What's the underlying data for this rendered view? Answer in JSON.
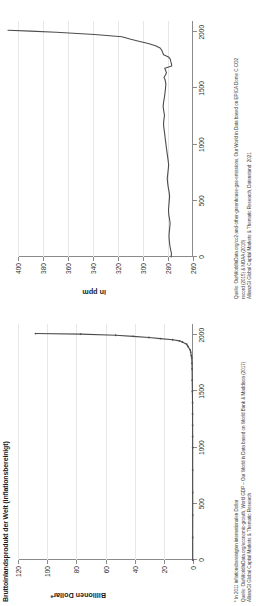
{
  "figure": {
    "background": "#ffffff",
    "line_color": "#4d4d4d",
    "grid_color": "#e8e8e8",
    "axis_color": "#8a8a8a"
  },
  "panels": [
    {
      "id": "gdp",
      "title": "Bruttoinlandsprodukt der Welt (inflationsbereinigt)",
      "ylabel": "Billionen Dollar*",
      "footnotes": [
        "* In 2011 inflationsbereinigten internationalen Dollar",
        "Quelle: OurWorldInData.org/economic-growth, World GDP – Our World in Data based on World Bank & Maddison (2017)",
        "AllianzGI Global Capital Markets & Thematic Research"
      ]
    },
    {
      "id": "co2",
      "title": "",
      "ylabel": "in ppm",
      "footnotes": [
        "Quelle: OurWorldInData.org/co2-and-other-greenhouse-gas-emissions, Our World in Data based on EPICA Dome C CO2",
        "record (2015) & NOAA (2018)",
        "AllianzGI Global Capital Markets & Thematic Research, Datenstand: 2021"
      ]
    }
  ],
  "chart_data": [
    {
      "type": "line",
      "title": "Bruttoinlandsprodukt der Welt (inflationsbereinigt)",
      "xlabel": "",
      "ylabel": "Billionen Dollar*",
      "xlim": [
        0,
        2100
      ],
      "ylim": [
        0,
        120
      ],
      "xticks": [
        0,
        500,
        1000,
        1500,
        2000
      ],
      "yticks": [
        0,
        20,
        40,
        60,
        80,
        100,
        120
      ],
      "grid": true,
      "legend": "none",
      "x": [
        1,
        200,
        400,
        600,
        800,
        1000,
        1100,
        1200,
        1300,
        1400,
        1500,
        1600,
        1700,
        1750,
        1800,
        1820,
        1850,
        1870,
        1900,
        1920,
        1940,
        1950,
        1960,
        1970,
        1980,
        1990,
        2000,
        2010,
        2015
      ],
      "values": [
        0.18,
        0.19,
        0.18,
        0.19,
        0.21,
        0.21,
        0.23,
        0.26,
        0.29,
        0.3,
        0.43,
        0.55,
        0.64,
        0.73,
        0.89,
        1.2,
        1.55,
        1.98,
        3.42,
        4.36,
        7.31,
        9.25,
        13.9,
        22.3,
        30.2,
        41.0,
        53.0,
        77.0,
        108.0
      ]
    },
    {
      "type": "line",
      "title": "",
      "xlabel": "",
      "ylabel": "in ppm",
      "xlim": [
        0,
        2100
      ],
      "ylim": [
        260,
        400
      ],
      "xticks": [
        0,
        500,
        1000,
        1500,
        2000
      ],
      "yticks": [
        260,
        280,
        300,
        320,
        340,
        360,
        380,
        400
      ],
      "grid": true,
      "legend": "none",
      "x": [
        0,
        30,
        60,
        100,
        140,
        180,
        220,
        260,
        300,
        340,
        380,
        420,
        460,
        500,
        540,
        580,
        620,
        660,
        700,
        740,
        780,
        820,
        860,
        900,
        940,
        980,
        1020,
        1060,
        1100,
        1140,
        1180,
        1220,
        1260,
        1300,
        1340,
        1380,
        1420,
        1460,
        1500,
        1540,
        1580,
        1600,
        1620,
        1640,
        1660,
        1680,
        1700,
        1720,
        1740,
        1760,
        1780,
        1800,
        1820,
        1840,
        1860,
        1880,
        1900,
        1920,
        1940,
        1960,
        1980,
        2000,
        2010,
        2018
      ],
      "values": [
        277.5,
        277.2,
        277.8,
        278.5,
        278.9,
        279.2,
        279.0,
        278.6,
        278.3,
        278.8,
        279.4,
        279.6,
        279.3,
        279.0,
        278.7,
        279.1,
        279.8,
        280.3,
        280.6,
        280.2,
        279.8,
        279.5,
        279.9,
        280.4,
        280.9,
        281.4,
        281.8,
        282.3,
        282.7,
        283.2,
        283.6,
        283.3,
        282.8,
        283.4,
        283.9,
        283.5,
        282.9,
        282.4,
        282.0,
        281.7,
        282.4,
        283.2,
        282.0,
        281.3,
        281.9,
        282.6,
        277.0,
        277.3,
        277.8,
        278.2,
        279.6,
        283.5,
        284.3,
        285.0,
        286.3,
        290.0,
        295.8,
        303.4,
        310.5,
        316.9,
        338.7,
        369.5,
        389.8,
        408.0
      ]
    }
  ]
}
